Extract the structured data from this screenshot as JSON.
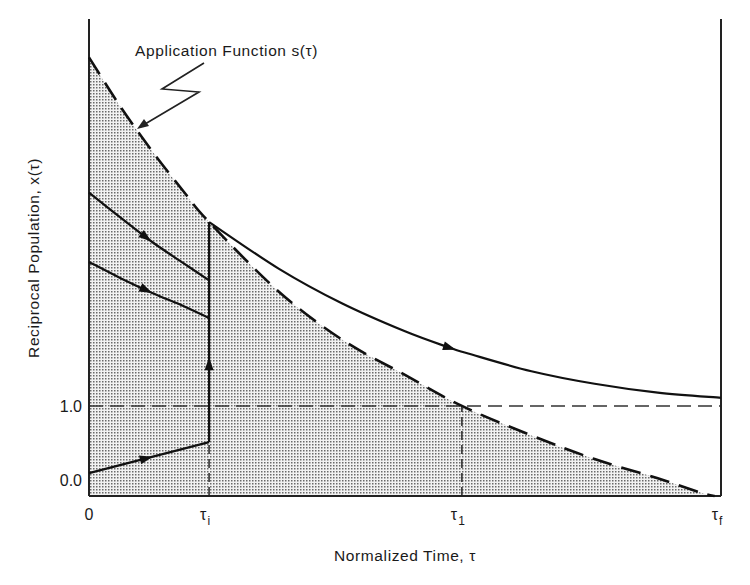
{
  "chart_data": {
    "type": "line",
    "title": "",
    "xlabel": "Normalized Time, τ",
    "ylabel": "Reciprocal Population, x(τ)",
    "xlim": [
      0,
      1.0
    ],
    "ylim": [
      -0.22,
      6.24
    ],
    "x_ticks": [
      {
        "value": 0,
        "label": "0"
      },
      {
        "value": 0.19,
        "label": "τ",
        "sub": "i"
      },
      {
        "value": 0.59,
        "label": "τ",
        "sub": "1"
      },
      {
        "value": 1.0,
        "label": "τ",
        "sub": "f"
      }
    ],
    "y_ticks": [
      {
        "value": 0.0,
        "label": "0.0"
      },
      {
        "value": 1.0,
        "label": "1.0"
      }
    ],
    "annotation": {
      "text": "Application Function s(τ)",
      "points_to": "application-function-curve"
    },
    "reference_lines": [
      {
        "orientation": "horizontal",
        "value": 1.0,
        "style": "dashed",
        "from": 0,
        "to": 1.0
      },
      {
        "orientation": "vertical",
        "value": 0.19,
        "style": "dashed",
        "from": -0.22,
        "to": 0.51
      },
      {
        "orientation": "vertical",
        "value": 0.59,
        "style": "dashed",
        "from": -0.22,
        "to": 1.0
      }
    ],
    "series": [
      {
        "name": "Application Function s(τ)",
        "style": "dashed",
        "shaded_below": true,
        "points": [
          [
            0,
            5.72
          ],
          [
            0.05,
            5.05
          ],
          [
            0.1,
            4.45
          ],
          [
            0.15,
            3.9
          ],
          [
            0.19,
            3.49
          ],
          [
            0.3,
            2.55
          ],
          [
            0.4,
            1.9
          ],
          [
            0.5,
            1.42
          ],
          [
            0.59,
            1.0
          ],
          [
            0.7,
            0.6
          ],
          [
            0.8,
            0.28
          ],
          [
            0.9,
            0.02
          ],
          [
            0.97,
            -0.18
          ],
          [
            0.99,
            -0.22
          ]
        ]
      },
      {
        "name": "trajectory-upper",
        "style": "solid",
        "arrow_at": 0.09,
        "points": [
          [
            0,
            3.89
          ],
          [
            0.05,
            3.55
          ],
          [
            0.1,
            3.22
          ],
          [
            0.15,
            2.93
          ],
          [
            0.19,
            2.7
          ]
        ]
      },
      {
        "name": "trajectory-middle",
        "style": "solid",
        "arrow_at": 0.09,
        "points": [
          [
            0,
            2.95
          ],
          [
            0.05,
            2.73
          ],
          [
            0.1,
            2.53
          ],
          [
            0.15,
            2.35
          ],
          [
            0.19,
            2.19
          ]
        ]
      },
      {
        "name": "trajectory-lower",
        "style": "solid",
        "arrow_at": 0.09,
        "points": [
          [
            0,
            0.09
          ],
          [
            0.19,
            0.51
          ]
        ]
      },
      {
        "name": "jump-at-tau-i",
        "style": "solid",
        "arrow_at_value": 1.55,
        "points": [
          [
            0.19,
            0.51
          ],
          [
            0.19,
            3.49
          ]
        ]
      },
      {
        "name": "trajectory-after-jump",
        "style": "solid",
        "arrow_at": 0.57,
        "points": [
          [
            0.19,
            3.49
          ],
          [
            0.3,
            2.86
          ],
          [
            0.4,
            2.39
          ],
          [
            0.5,
            2.01
          ],
          [
            0.57,
            1.79
          ],
          [
            0.6,
            1.71
          ],
          [
            0.7,
            1.47
          ],
          [
            0.8,
            1.3
          ],
          [
            0.9,
            1.18
          ],
          [
            1.0,
            1.11
          ]
        ]
      }
    ]
  }
}
